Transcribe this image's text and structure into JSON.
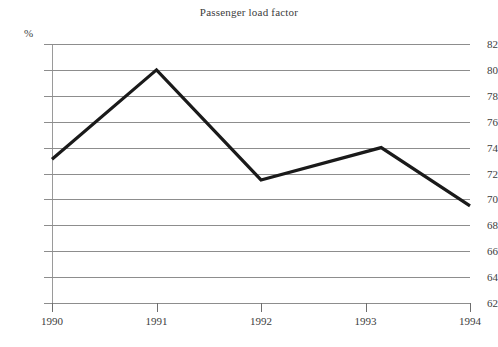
{
  "chart_data": {
    "type": "line",
    "title": "Passenger load factor",
    "xlabel": "",
    "ylabel": "%",
    "unit_label": "%",
    "x": [
      1990,
      1991,
      1992,
      1993.15,
      1994
    ],
    "categories": [
      "1990",
      "1991",
      "1992",
      "1993",
      "1994"
    ],
    "values": [
      73.1,
      80.0,
      71.5,
      74.0,
      69.5
    ],
    "series": [
      {
        "name": "Passenger load factor",
        "values": [
          73.1,
          80.0,
          71.5,
          74.0,
          69.5
        ],
        "color": "#1a1a1a"
      }
    ],
    "xlim": [
      1990,
      1994
    ],
    "ylim": [
      62,
      82
    ],
    "ytick_values": [
      82,
      80,
      78,
      76,
      74,
      72,
      70,
      68,
      66,
      64,
      62
    ],
    "ytick_labels": [
      "82",
      "80",
      "78",
      "76",
      "74",
      "72",
      "70",
      "68",
      "66",
      "64",
      "62"
    ],
    "xtick_values": [
      1990,
      1991,
      1992,
      1993,
      1994
    ],
    "xtick_labels": [
      "1990",
      "1991",
      "1992",
      "1993",
      "1994"
    ],
    "grid": true,
    "grid_axis": "y",
    "legend": false,
    "legend_position": "none",
    "annotations": [],
    "colors": {
      "line": "#1a1a1a",
      "grid": "#8d8d8d",
      "axis": "#9a9a9a",
      "text": "#3c3c3c",
      "background": "#ffffff"
    },
    "note": "Peak of the 1993 segment occurs slightly to the right of the 1993 tick."
  }
}
